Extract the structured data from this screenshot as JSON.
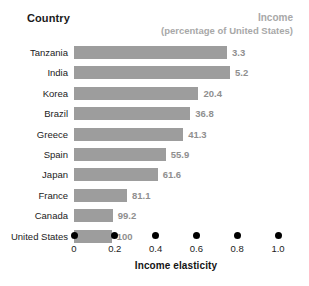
{
  "chart_data": {
    "type": "bar",
    "orientation": "horizontal",
    "title": "",
    "xlabel": "Income elasticity",
    "ylabel": "Country",
    "xlim": [
      0,
      1.0
    ],
    "xticks": [
      "0",
      "0.2",
      "0.4",
      "0.6",
      "0.8",
      "1.0"
    ],
    "xtick_values": [
      0,
      0.2,
      0.4,
      0.6,
      0.8,
      1.0
    ],
    "grid": false,
    "legend": "none",
    "bar_color": "#9d9d9d",
    "categories": [
      "Tanzania",
      "India",
      "Korea",
      "Brazil",
      "Greece",
      "Spain",
      "Japan",
      "France",
      "Canada",
      "United States"
    ],
    "values": [
      0.75,
      0.765,
      0.61,
      0.57,
      0.535,
      0.45,
      0.41,
      0.26,
      0.19,
      0.185
    ],
    "data_labels": [
      "3.3",
      "5.2",
      "20.4",
      "36.8",
      "41.3",
      "55.9",
      "61.6",
      "81.1",
      "99.2",
      "100"
    ],
    "data_label_meaning": "Income (percentage of United States)",
    "rows": [
      {
        "country": "Tanzania",
        "elasticity": 0.75,
        "income_label": "3.3"
      },
      {
        "country": "India",
        "elasticity": 0.765,
        "income_label": "5.2"
      },
      {
        "country": "Korea",
        "elasticity": 0.61,
        "income_label": "20.4"
      },
      {
        "country": "Brazil",
        "elasticity": 0.57,
        "income_label": "36.8"
      },
      {
        "country": "Greece",
        "elasticity": 0.535,
        "income_label": "41.3"
      },
      {
        "country": "Spain",
        "elasticity": 0.45,
        "income_label": "55.9"
      },
      {
        "country": "Japan",
        "elasticity": 0.41,
        "income_label": "61.6"
      },
      {
        "country": "France",
        "elasticity": 0.26,
        "income_label": "81.1"
      },
      {
        "country": "Canada",
        "elasticity": 0.19,
        "income_label": "99.2"
      },
      {
        "country": "United States",
        "elasticity": 0.185,
        "income_label": "100"
      }
    ]
  },
  "header": {
    "country_label": "Country",
    "income_label": "Income",
    "income_sublabel": "(percentage of United States)"
  },
  "axis": {
    "title": "Income elasticity"
  },
  "colors": {
    "bar": "#9d9d9d",
    "value_text": "#8f8f8f",
    "header_gray": "#a8a8a8",
    "axis_text": "#1c1c1c",
    "background": "#ffffff"
  }
}
